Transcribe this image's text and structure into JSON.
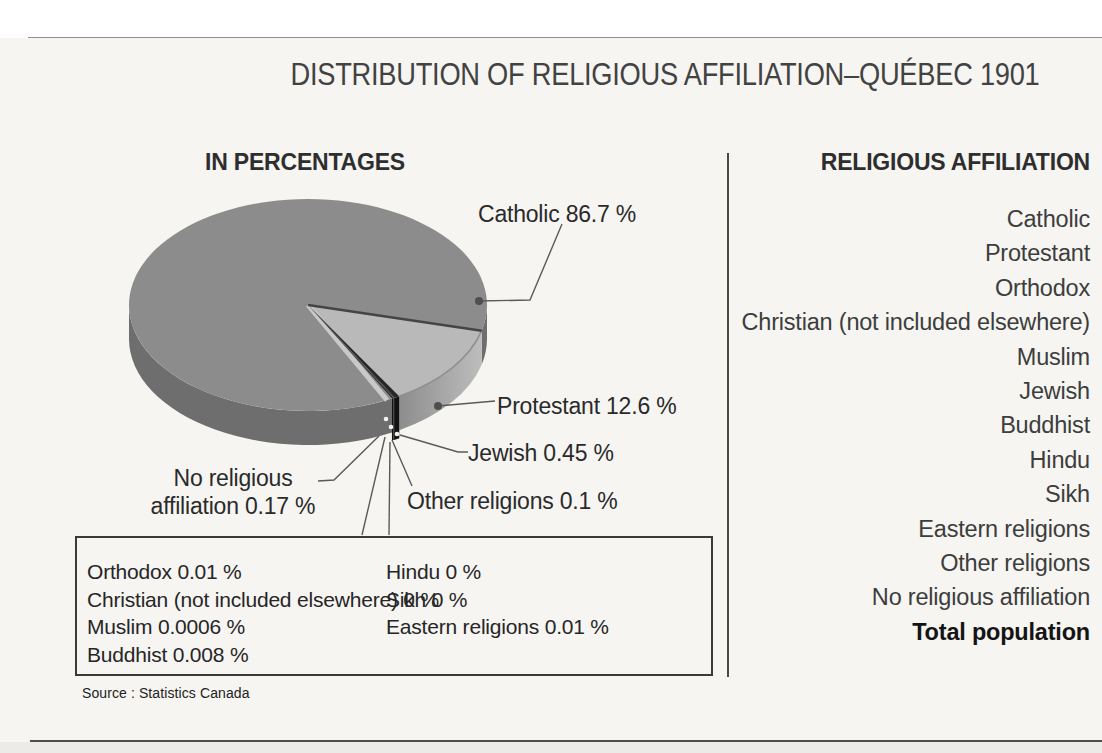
{
  "page": {
    "title": "DISTRIBUTION OF RELIGIOUS AFFILIATION–QUÉBEC 1901",
    "left_header": "IN PERCENTAGES",
    "source": "Source : Statistics Canada"
  },
  "chart_data": {
    "type": "pie",
    "title": "DISTRIBUTION OF RELIGIOUS AFFILIATION–QUÉBEC 1901",
    "unit": "percent of population",
    "style": "3d-pie, grayscale",
    "start_angle": 14,
    "draw_order": [
      "Protestant",
      "Jewish",
      "Other religions",
      "Orthodox",
      "Christian (not included elsewhere)",
      "Muslim",
      "Buddhist",
      "Hindu",
      "Sikh",
      "Eastern religions",
      "No religious affiliation",
      "Catholic"
    ],
    "slices": [
      {
        "label": "Catholic",
        "value": 86.7,
        "display": "Catholic 86.7 %"
      },
      {
        "label": "Protestant",
        "value": 12.6,
        "display": "Protestant 12.6 %"
      },
      {
        "label": "Orthodox",
        "value": 0.01,
        "display": "Orthodox 0.01 %"
      },
      {
        "label": "Christian (not included elsewhere)",
        "value": 0,
        "display": "Christian (not included elsewhere) 0 %"
      },
      {
        "label": "Muslim",
        "value": 0.0006,
        "display": "Muslim 0.0006 %"
      },
      {
        "label": "Jewish",
        "value": 0.45,
        "display": "Jewish 0.45 %"
      },
      {
        "label": "Buddhist",
        "value": 0.008,
        "display": "Buddhist 0.008 %"
      },
      {
        "label": "Hindu",
        "value": 0,
        "display": "Hindu 0 %"
      },
      {
        "label": "Sikh",
        "value": 0,
        "display": "Sikh 0 %"
      },
      {
        "label": "Eastern religions",
        "value": 0.01,
        "display": "Eastern religions 0.01 %"
      },
      {
        "label": "Other religions",
        "value": 0.1,
        "display": "Other religions 0.1 %"
      },
      {
        "label": "No religious affiliation",
        "value": 0.17,
        "display": "No religious affiliation 0.17 %"
      }
    ],
    "callouts": {
      "catholic": "Catholic 86.7 %",
      "protestant": "Protestant 12.6 %",
      "jewish": "Jewish 0.45 %",
      "other": "Other religions 0.1 %",
      "no_religion_line1": "No religious",
      "no_religion_line2": "affiliation 0.17 %"
    },
    "colors": {
      "catholic_top": "#8c8c8c",
      "catholic_side": "#6e6e6e",
      "protestant_top": "#b9b9b9",
      "protestant_side_from": "#8d8d8d",
      "protestant_side_to": "#bdbdbd",
      "minor_top": "#262626",
      "minor_side": "#121212",
      "cut_highlight": "#c9c9c9",
      "edge_line": "#454545",
      "rim_line": "#8f8f8f",
      "leader": "#5a5a5a",
      "dot": "#4f4f4f",
      "dot_light": "#f2f2f2"
    }
  },
  "box": {
    "left_column": [
      "Orthodox 0.01 %",
      "Christian (not included elsewhere) 0 %",
      "Muslim 0.0006 %",
      "Buddhist 0.008 %"
    ],
    "right_column": [
      "Hindu 0 %",
      "Sikh 0 %",
      "Eastern religions 0.01 %"
    ]
  },
  "legend": {
    "header": "RELIGIOUS AFFILIATION",
    "items": [
      "Catholic",
      "Protestant",
      "Orthodox",
      "Christian (not included elsewhere)",
      "Muslim",
      "Jewish",
      "Buddhist",
      "Hindu",
      "Sikh",
      "Eastern religions",
      "Other religions",
      "No religious affiliation"
    ],
    "total": "Total population"
  }
}
